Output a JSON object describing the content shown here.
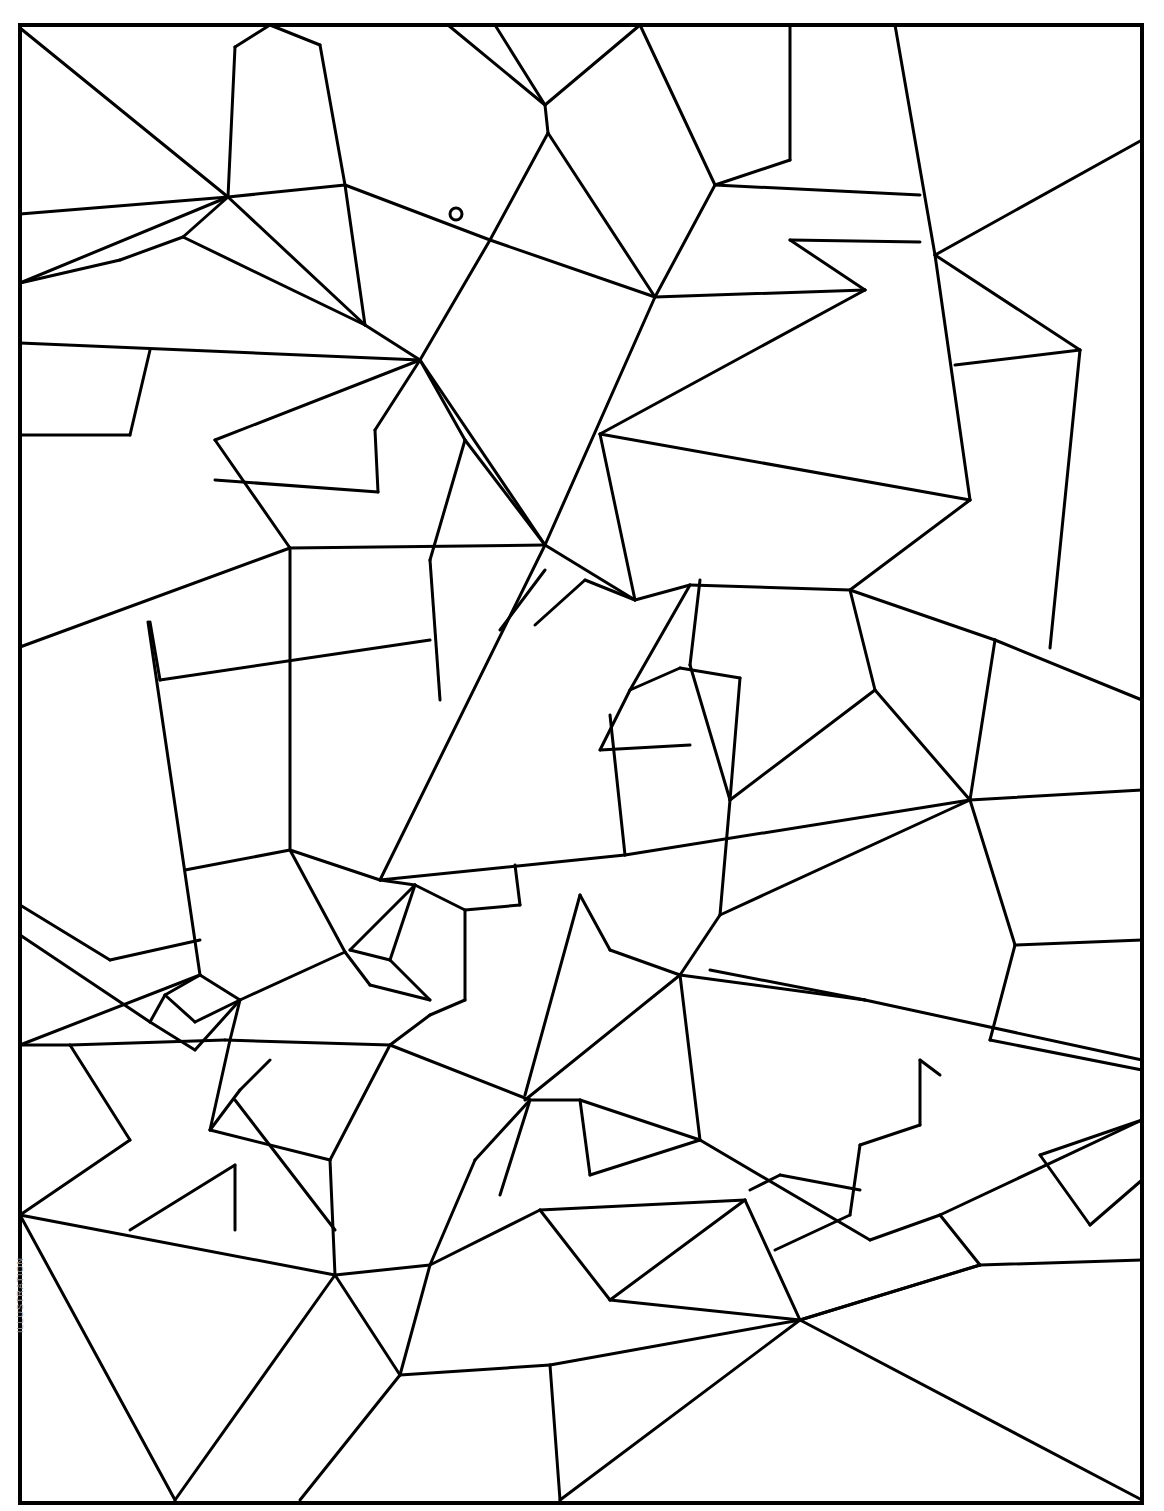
{
  "page": {
    "background": "#ffffff",
    "stroke_color": "#000000",
    "credit_text": "ILLUSTRATION"
  },
  "frame": {
    "x": 20,
    "y": 25,
    "width": 1122,
    "height": 1478,
    "stroke_width": 4
  },
  "marker": {
    "label": "o",
    "cx": 456,
    "cy": 214,
    "r": 6
  },
  "lines": [
    [
      20,
      28,
      228,
      197
    ],
    [
      228,
      197,
      20,
      283
    ],
    [
      20,
      214,
      228,
      197
    ],
    [
      228,
      197,
      345,
      185
    ],
    [
      228,
      197,
      235,
      47
    ],
    [
      235,
      47,
      270,
      25
    ],
    [
      270,
      25,
      320,
      45
    ],
    [
      320,
      45,
      345,
      185
    ],
    [
      345,
      185,
      490,
      240
    ],
    [
      345,
      185,
      365,
      325
    ],
    [
      365,
      325,
      420,
      360
    ],
    [
      228,
      197,
      365,
      325
    ],
    [
      20,
      283,
      120,
      260
    ],
    [
      120,
      260,
      183,
      237
    ],
    [
      183,
      237,
      228,
      197
    ],
    [
      183,
      237,
      365,
      325
    ],
    [
      20,
      343,
      420,
      360
    ],
    [
      420,
      360,
      490,
      240
    ],
    [
      490,
      240,
      548,
      133
    ],
    [
      548,
      133,
      545,
      105
    ],
    [
      545,
      105,
      495,
      25
    ],
    [
      448,
      25,
      545,
      105
    ],
    [
      545,
      105,
      640,
      25
    ],
    [
      640,
      25,
      715,
      185
    ],
    [
      715,
      185,
      790,
      160
    ],
    [
      790,
      160,
      790,
      25
    ],
    [
      548,
      133,
      655,
      297
    ],
    [
      655,
      297,
      715,
      185
    ],
    [
      490,
      240,
      655,
      297
    ],
    [
      655,
      297,
      865,
      290
    ],
    [
      865,
      290,
      790,
      240
    ],
    [
      790,
      240,
      920,
      242
    ],
    [
      715,
      185,
      920,
      195
    ],
    [
      895,
      25,
      935,
      255
    ],
    [
      935,
      255,
      1142,
      140
    ],
    [
      935,
      255,
      970,
      500
    ],
    [
      935,
      255,
      1080,
      350
    ],
    [
      1080,
      350,
      955,
      365
    ],
    [
      1080,
      350,
      1050,
      648
    ],
    [
      970,
      500,
      600,
      434
    ],
    [
      600,
      434,
      865,
      290
    ],
    [
      600,
      434,
      635,
      600
    ],
    [
      655,
      297,
      545,
      545
    ],
    [
      545,
      545,
      420,
      360
    ],
    [
      420,
      360,
      215,
      440
    ],
    [
      215,
      440,
      290,
      548
    ],
    [
      290,
      548,
      545,
      545
    ],
    [
      290,
      548,
      20,
      647
    ],
    [
      420,
      360,
      465,
      440
    ],
    [
      465,
      440,
      545,
      545
    ],
    [
      465,
      440,
      430,
      560
    ],
    [
      375,
      430,
      378,
      492
    ],
    [
      378,
      492,
      215,
      480
    ],
    [
      375,
      430,
      420,
      360
    ],
    [
      150,
      350,
      130,
      435
    ],
    [
      20,
      435,
      130,
      435
    ],
    [
      290,
      548,
      290,
      850
    ],
    [
      150,
      622,
      160,
      680
    ],
    [
      160,
      680,
      430,
      640
    ],
    [
      430,
      560,
      440,
      700
    ],
    [
      148,
      622,
      200,
      975
    ],
    [
      200,
      975,
      20,
      1045
    ],
    [
      545,
      545,
      635,
      600
    ],
    [
      635,
      600,
      690,
      585
    ],
    [
      690,
      585,
      850,
      590
    ],
    [
      850,
      590,
      970,
      500
    ],
    [
      850,
      590,
      995,
      640
    ],
    [
      995,
      640,
      1142,
      700
    ],
    [
      995,
      640,
      970,
      800
    ],
    [
      850,
      590,
      875,
      690
    ],
    [
      875,
      690,
      970,
      800
    ],
    [
      875,
      690,
      730,
      800
    ],
    [
      545,
      545,
      380,
      880
    ],
    [
      380,
      880,
      625,
      855
    ],
    [
      625,
      855,
      970,
      800
    ],
    [
      970,
      800,
      1142,
      790
    ],
    [
      970,
      800,
      1015,
      945
    ],
    [
      1015,
      945,
      1142,
      940
    ],
    [
      1015,
      945,
      990,
      1040
    ],
    [
      990,
      1040,
      1142,
      1070
    ],
    [
      690,
      585,
      630,
      690
    ],
    [
      630,
      690,
      680,
      668
    ],
    [
      680,
      668,
      740,
      678
    ],
    [
      740,
      678,
      730,
      800
    ],
    [
      700,
      580,
      690,
      665
    ],
    [
      690,
      665,
      730,
      800
    ],
    [
      600,
      750,
      690,
      745
    ],
    [
      600,
      750,
      630,
      690
    ],
    [
      535,
      625,
      585,
      580
    ],
    [
      585,
      580,
      635,
      600
    ],
    [
      500,
      630,
      545,
      570
    ],
    [
      610,
      715,
      625,
      855
    ],
    [
      720,
      915,
      730,
      800
    ],
    [
      970,
      800,
      720,
      915
    ],
    [
      290,
      850,
      380,
      880
    ],
    [
      290,
      850,
      185,
      870
    ],
    [
      380,
      880,
      415,
      885
    ],
    [
      415,
      885,
      465,
      910
    ],
    [
      465,
      910,
      465,
      1000
    ],
    [
      465,
      910,
      520,
      905
    ],
    [
      520,
      905,
      515,
      865
    ],
    [
      350,
      950,
      415,
      885
    ],
    [
      350,
      950,
      390,
      960
    ],
    [
      390,
      960,
      415,
      885
    ],
    [
      390,
      960,
      430,
      1000
    ],
    [
      430,
      1000,
      370,
      985
    ],
    [
      370,
      985,
      345,
      952
    ],
    [
      465,
      1000,
      430,
      1015
    ],
    [
      345,
      952,
      290,
      850
    ],
    [
      345,
      952,
      240,
      1000
    ],
    [
      240,
      1000,
      200,
      975
    ],
    [
      200,
      975,
      165,
      995
    ],
    [
      165,
      995,
      195,
      1022
    ],
    [
      195,
      1022,
      240,
      1000
    ],
    [
      165,
      995,
      150,
      1022
    ],
    [
      150,
      1022,
      195,
      1050
    ],
    [
      195,
      1050,
      240,
      1000
    ],
    [
      20,
      905,
      110,
      960
    ],
    [
      110,
      960,
      200,
      940
    ],
    [
      20,
      935,
      150,
      1022
    ],
    [
      20,
      1045,
      70,
      1045
    ],
    [
      70,
      1045,
      225,
      1040
    ],
    [
      70,
      1045,
      130,
      1140
    ],
    [
      130,
      1140,
      20,
      1215
    ],
    [
      225,
      1040,
      390,
      1045
    ],
    [
      390,
      1045,
      530,
      1100
    ],
    [
      390,
      1045,
      430,
      1015
    ],
    [
      525,
      1095,
      580,
      895
    ],
    [
      580,
      895,
      610,
      950
    ],
    [
      610,
      950,
      680,
      975
    ],
    [
      680,
      975,
      720,
      915
    ],
    [
      680,
      975,
      525,
      1100
    ],
    [
      680,
      975,
      700,
      1140
    ],
    [
      680,
      975,
      865,
      1000
    ],
    [
      865,
      1000,
      1142,
      1060
    ],
    [
      865,
      1000,
      710,
      970
    ],
    [
      700,
      1140,
      580,
      1100
    ],
    [
      580,
      1100,
      530,
      1100
    ],
    [
      580,
      1100,
      590,
      1175
    ],
    [
      590,
      1175,
      700,
      1140
    ],
    [
      700,
      1140,
      870,
      1240
    ],
    [
      870,
      1240,
      940,
      1215
    ],
    [
      940,
      1215,
      980,
      1265
    ],
    [
      940,
      1215,
      1142,
      1120
    ],
    [
      20,
      1215,
      335,
      1275
    ],
    [
      335,
      1275,
      430,
      1265
    ],
    [
      430,
      1265,
      400,
      1375
    ],
    [
      400,
      1375,
      550,
      1365
    ],
    [
      550,
      1365,
      800,
      1320
    ],
    [
      800,
      1320,
      980,
      1265
    ],
    [
      980,
      1265,
      1142,
      1260
    ],
    [
      20,
      1215,
      175,
      1500
    ],
    [
      175,
      1500,
      335,
      1275
    ],
    [
      335,
      1275,
      400,
      1375
    ],
    [
      400,
      1375,
      300,
      1500
    ],
    [
      550,
      1365,
      560,
      1500
    ],
    [
      560,
      1500,
      800,
      1320
    ],
    [
      800,
      1320,
      1142,
      1500
    ],
    [
      800,
      1320,
      980,
      1265
    ],
    [
      430,
      1265,
      540,
      1210
    ],
    [
      540,
      1210,
      745,
      1200
    ],
    [
      745,
      1200,
      800,
      1320
    ],
    [
      540,
      1210,
      610,
      1300
    ],
    [
      610,
      1300,
      745,
      1200
    ],
    [
      610,
      1300,
      800,
      1320
    ],
    [
      1040,
      1155,
      1142,
      1120
    ],
    [
      1040,
      1155,
      1090,
      1225
    ],
    [
      1090,
      1225,
      1142,
      1180
    ],
    [
      240,
      1000,
      230,
      1040
    ],
    [
      230,
      1040,
      210,
      1130
    ],
    [
      210,
      1130,
      240,
      1090
    ],
    [
      240,
      1090,
      270,
      1060
    ],
    [
      210,
      1130,
      330,
      1160
    ],
    [
      330,
      1160,
      335,
      1275
    ],
    [
      330,
      1160,
      390,
      1045
    ],
    [
      235,
      1100,
      335,
      1230
    ],
    [
      130,
      1230,
      235,
      1165
    ],
    [
      235,
      1165,
      235,
      1230
    ],
    [
      775,
      1250,
      850,
      1215
    ],
    [
      850,
      1215,
      860,
      1145
    ],
    [
      860,
      1145,
      920,
      1125
    ],
    [
      920,
      1125,
      920,
      1060
    ],
    [
      920,
      1060,
      940,
      1075
    ],
    [
      780,
      1175,
      860,
      1190
    ],
    [
      750,
      1190,
      780,
      1175
    ],
    [
      475,
      1160,
      530,
      1100
    ],
    [
      475,
      1160,
      430,
      1265
    ],
    [
      530,
      1100,
      500,
      1195
    ]
  ]
}
